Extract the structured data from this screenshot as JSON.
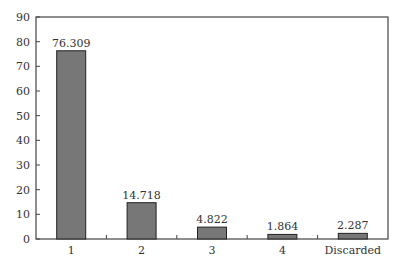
{
  "chart_data": {
    "type": "bar",
    "title": "",
    "xlabel": "",
    "ylabel": "",
    "categories": [
      "1",
      "2",
      "3",
      "4",
      "Discarded"
    ],
    "values": [
      76.309,
      14.718,
      4.822,
      1.864,
      2.287
    ],
    "data_labels": [
      "76.309",
      "14.718",
      "4.822",
      "1.864",
      "2.287"
    ],
    "ylim": [
      0,
      90
    ],
    "yticks": [
      0,
      10,
      20,
      30,
      40,
      50,
      60,
      70,
      80,
      90
    ],
    "grid": false,
    "legend": null,
    "colors": {
      "bar_fill": "#777777",
      "bar_stroke": "#222222",
      "axis": "#444444"
    }
  }
}
